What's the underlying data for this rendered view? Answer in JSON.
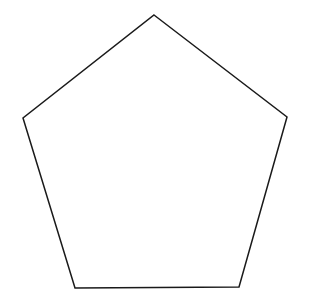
{
  "diagram": {
    "shape": "pentagon",
    "background": "#ffffff",
    "fill": "#ffffff",
    "stroke": "#1a1a1a",
    "stroke_width": 1.5,
    "vertices": [
      {
        "name": "top",
        "x": 154,
        "y": 15
      },
      {
        "name": "right",
        "x": 287,
        "y": 117
      },
      {
        "name": "bottom-right",
        "x": 239,
        "y": 287
      },
      {
        "name": "bottom-left",
        "x": 75,
        "y": 288
      },
      {
        "name": "left",
        "x": 23,
        "y": 118
      }
    ]
  }
}
